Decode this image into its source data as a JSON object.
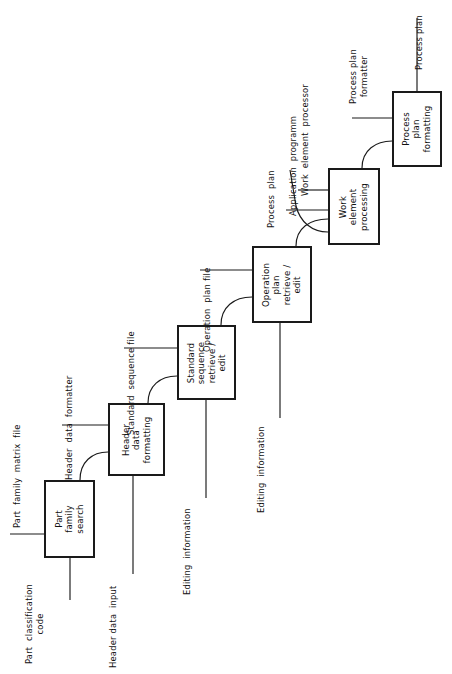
{
  "diagram": {
    "orientation": "rotated-90-ccw",
    "line_color": "#1a1a1a",
    "box_border_color": "#1a1a1a",
    "background_color": "#ffffff",
    "boxes": [
      {
        "id": "part-family-search",
        "label": "Part\nfamily\nsearch"
      },
      {
        "id": "header-data-formatting",
        "label": "Header\ndata\nformatting"
      },
      {
        "id": "standard-sequence-retrieve-edit",
        "label": "Standard\nsequence\nretrieve /\nedit"
      },
      {
        "id": "operation-plan-retrieve-edit",
        "label": "Operation\nplan\nretrieve /\nedit"
      },
      {
        "id": "work-element-processing",
        "label": "Work\nelement\nprocessing"
      },
      {
        "id": "process-plan-formatting",
        "label": "Process\nplan\nformatting"
      }
    ],
    "labels": [
      {
        "id": "part-classification-code",
        "text": "Part  classification\ncode"
      },
      {
        "id": "part-family-matrix-file",
        "text": "Part  family  matrix  file"
      },
      {
        "id": "header-data-input",
        "text": "Header data  input"
      },
      {
        "id": "header-data-formatter",
        "text": "Header  data  formatter"
      },
      {
        "id": "editing-information-1",
        "text": "Editing  information"
      },
      {
        "id": "standard-sequence-file",
        "text": "Standard  sequence file"
      },
      {
        "id": "editing-information-2",
        "text": "Editing  information"
      },
      {
        "id": "operation-plan-file",
        "text": "Operation  plan file"
      },
      {
        "id": "process-plan-in",
        "text": "Process  plan"
      },
      {
        "id": "application-programm",
        "text": "Application  programm"
      },
      {
        "id": "work-element-processor",
        "text": "Work  element  processor"
      },
      {
        "id": "process-plan-formatter",
        "text": "Process plan\nformatter"
      },
      {
        "id": "process-plan-out",
        "text": "Process plan"
      }
    ]
  }
}
